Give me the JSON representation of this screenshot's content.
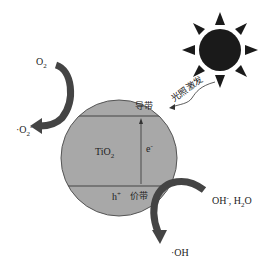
{
  "diagram": {
    "material": "TiO",
    "material_sub": "2",
    "conduction_band": "导带",
    "valence_band": "价带",
    "electron": "e",
    "electron_sup": "-",
    "hole": "h",
    "hole_sup": "+",
    "excitation": "光照激发",
    "o2": "O",
    "o2_sub": "2",
    "superoxide": "·O",
    "superoxide_sub": "2",
    "superoxide_sup": "-",
    "reactants_right": "OH",
    "reactants_right_sup": "-",
    "reactants_right_rest": ", H",
    "water_sub": "2",
    "water_o": "O",
    "hydroxyl": "·OH",
    "colors": {
      "particle": "#a9a9a9",
      "arrow": "#444444",
      "sun": "#1a1a1a"
    }
  }
}
